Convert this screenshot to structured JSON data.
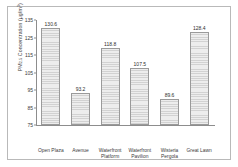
{
  "chart_data": {
    "type": "bar",
    "title": "",
    "xlabel": "",
    "ylabel": "PM2.5 Concentration (μg/m³)",
    "ylabel_parts": {
      "prefix": "PM",
      "subscript": "2.5",
      "middle": " Concentration (μg/m",
      "superscript": "3",
      "suffix": ")"
    },
    "categories": [
      "Open Plaza",
      "Avenue",
      "Waterfront Platform",
      "Waterfront Pavilion",
      "Wisteria Pergola",
      "Great Lawn"
    ],
    "category_lines": [
      [
        "Open Plaza"
      ],
      [
        "Avenue"
      ],
      [
        "Waterfront",
        "Platform"
      ],
      [
        "Waterfront",
        "Pavilion"
      ],
      [
        "Wisteria",
        "Pergola"
      ],
      [
        "Great Lawn"
      ]
    ],
    "values": [
      130.6,
      93.2,
      118.8,
      107.5,
      89.6,
      128.4
    ],
    "value_labels": [
      "130.6",
      "93.2",
      "118.8",
      "107.5",
      "89.6",
      "128.4"
    ],
    "ylim": [
      75,
      135
    ],
    "yticks": [
      135,
      125,
      115,
      105,
      95,
      85,
      75
    ],
    "ytick_labels": [
      "135",
      "125",
      "115",
      "105",
      "95",
      "85",
      "75"
    ],
    "grid": false,
    "legend": null,
    "bar_fill": "#e8e8e8",
    "bar_edge": "#9a9a9a",
    "axis_color": "#8d8d8d",
    "text_color": "#3a3a3a",
    "background": "#ffffff",
    "frame_color": "#b9b9b9"
  }
}
